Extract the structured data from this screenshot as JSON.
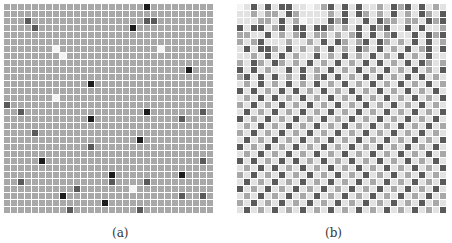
{
  "figure": {
    "panels": [
      {
        "caption": "(a)",
        "rows": 30,
        "cols": 30,
        "legend_levels": {
          "0": "empty",
          "1": "light gray",
          "2": "medium gray",
          "3": "dark gray",
          "4": "black"
        },
        "colors": {
          "0": "#f4f4f4",
          "1": "#e2e2e2",
          "2": "#a8a8a8",
          "3": "#5a5a5a",
          "4": "#1c1c1c"
        },
        "cells": [
          "222222222222222222224222222222",
          "222222222222222222222222222222",
          "222322222222222222223322222222",
          "222232222222222222422222222222",
          "222222222222222222222222222222",
          "222222222222222222222222222222",
          "222222202222222222222202222222",
          "222222220222222222222222222222",
          "222222222222222222222222222222",
          "222222222222222222222222224222",
          "222222222222222222222222222222",
          "222222222222422222222222222222",
          "222222222222222222222222222222",
          "222222202222222222222222222222",
          "322222222222222222222222222222",
          "223222222222222222224222222232",
          "222222222222422222222222232222",
          "222222222222222222222222222222",
          "222232222222222222222222222222",
          "222222222222222222242222222222",
          "222222222222322222222222222222",
          "222222222222222222222222222222",
          "222224222222222222222222222232",
          "222222222222222222222222222222",
          "222222222222222422222222242222",
          "223222222222222322223222222222",
          "222222222232222222022222222222",
          "222222224222222222222222232232",
          "222222222222224222222222222222",
          "222222222322222222232222222222"
        ]
      },
      {
        "caption": "(b)",
        "rows": 30,
        "cols": 30,
        "colors": {
          "0": "#f4f4f4",
          "1": "#e2e2e2",
          "2": "#a8a8a8",
          "3": "#5a5a5a",
          "4": "#1c1c1c"
        },
        "cells": [
          "013131331101231313112132313121",
          "112122132111121313212131213213",
          "111221312011132311313221221323",
          "313312313313321213132311313112",
          "221131212312212123131231131323",
          "212311121121313212313212131312",
          "131332131212131213213121312313",
          "112131312113121312131213121311",
          "213213212131213121313121313212",
          "313121131312131213121312131213",
          "231313121312313121313121313121",
          "121312131213121312131213121312",
          "313121313121312131213121312131",
          "121313121312131213121312131213",
          "213121312131213121312131213121",
          "131213121312131213121312131213",
          "312131213121312131213121312131",
          "121312131213121312131213121312",
          "213121312131213121312131213121",
          "131213121312131213121312131213",
          "312131213121312131213121312131",
          "121312131213121312131213121312",
          "313121313121312131213121312131",
          "121313121312131213121312131213",
          "213121312131213121312131213121",
          "131213121312131213121312131213",
          "312131213121312131213121312131",
          "121312131213121312131213121312",
          "213121312131213121312131213121",
          "131213121312131213121312131213"
        ]
      }
    ]
  }
}
